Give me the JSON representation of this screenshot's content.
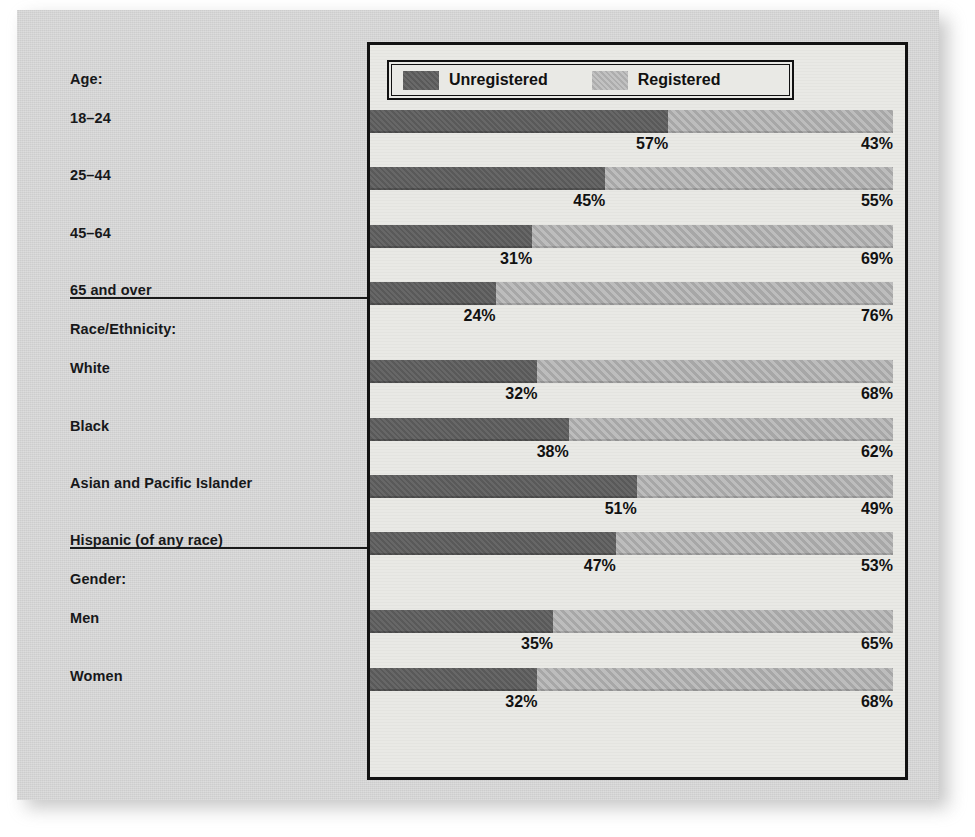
{
  "legend": {
    "unregistered_label": "Unregistered",
    "registered_label": "Registered",
    "unregistered_color": "#5e5e5e",
    "registered_color": "#b0b0b0"
  },
  "groups": [
    {
      "heading": "Age:",
      "rows": [
        "18–24",
        "25–44",
        "45–64",
        "65 and over"
      ]
    },
    {
      "heading": "Race/Ethnicity:",
      "rows": [
        "White",
        "Black",
        "Asian and Pacific Islander",
        "Hispanic (of any race)"
      ]
    },
    {
      "heading": "Gender:",
      "rows": [
        "Men",
        "Women"
      ]
    }
  ],
  "values": {
    "unregistered": [
      "57%",
      "45%",
      "31%",
      "24%",
      "32%",
      "38%",
      "51%",
      "47%",
      "35%",
      "32%"
    ],
    "registered": [
      "43%",
      "55%",
      "69%",
      "76%",
      "68%",
      "62%",
      "49%",
      "53%",
      "65%",
      "68%"
    ]
  },
  "chart_data": {
    "type": "bar",
    "orientation": "horizontal",
    "stacked": true,
    "normalized": true,
    "title": "",
    "xlabel": "",
    "ylabel": "",
    "xlim": [
      0,
      100
    ],
    "grid": false,
    "legend_position": "top-inside-left",
    "categories": [
      "18–24",
      "25–44",
      "45–64",
      "65 and over",
      "White",
      "Black",
      "Asian and Pacific Islander",
      "Hispanic (of any race)",
      "Men",
      "Women"
    ],
    "category_groups": {
      "Age:": [
        "18–24",
        "25–44",
        "45–64",
        "65 and over"
      ],
      "Race/Ethnicity:": [
        "White",
        "Black",
        "Asian and Pacific Islander",
        "Hispanic (of any race)"
      ],
      "Gender:": [
        "Men",
        "Women"
      ]
    },
    "series": [
      {
        "name": "Unregistered",
        "color": "#5e5e5e",
        "values": [
          57,
          45,
          31,
          24,
          32,
          38,
          51,
          47,
          35,
          32
        ]
      },
      {
        "name": "Registered",
        "color": "#b0b0b0",
        "values": [
          43,
          55,
          69,
          76,
          68,
          62,
          49,
          53,
          65,
          68
        ]
      }
    ],
    "data_labels": [
      {
        "category": "18–24",
        "Unregistered": "57%",
        "Registered": "43%"
      },
      {
        "category": "25–44",
        "Unregistered": "45%",
        "Registered": "55%"
      },
      {
        "category": "45–64",
        "Unregistered": "31%",
        "Registered": "69%"
      },
      {
        "category": "65 and over",
        "Unregistered": "24%",
        "Registered": "76%"
      },
      {
        "category": "White",
        "Unregistered": "32%",
        "Registered": "68%"
      },
      {
        "category": "Black",
        "Unregistered": "38%",
        "Registered": "62%"
      },
      {
        "category": "Asian and Pacific Islander",
        "Unregistered": "51%",
        "Registered": "49%"
      },
      {
        "category": "Hispanic (of any race)",
        "Unregistered": "47%",
        "Registered": "53%"
      },
      {
        "category": "Men",
        "Unregistered": "35%",
        "Registered": "65%"
      },
      {
        "category": "Women",
        "Unregistered": "32%",
        "Registered": "68%"
      }
    ]
  }
}
